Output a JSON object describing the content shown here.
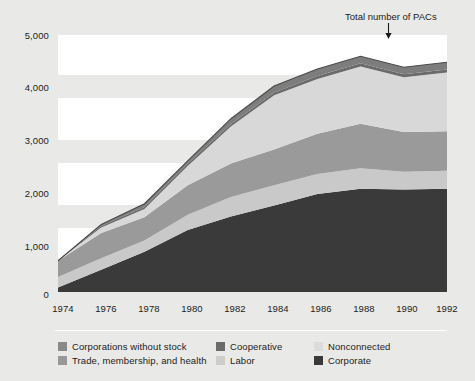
{
  "chart_data": {
    "type": "area",
    "stacked": true,
    "title": "",
    "xlabel": "",
    "ylabel": "",
    "x": [
      1974,
      1976,
      1978,
      1980,
      1982,
      1984,
      1986,
      1988,
      1990,
      1992
    ],
    "categories": [
      1974,
      1976,
      1978,
      1980,
      1982,
      1984,
      1986,
      1988,
      1990,
      1992
    ],
    "xlim": [
      1974,
      1992
    ],
    "ylim": [
      0,
      5000
    ],
    "yticks": [
      0,
      1000,
      2000,
      3000,
      4000,
      5000
    ],
    "ytick_labels": [
      "0",
      "1,000",
      "2,000",
      "3,000",
      "4,000",
      "5,000"
    ],
    "xtick_labels": [
      "1974",
      "1976",
      "1978",
      "1980",
      "1982",
      "1984",
      "1986",
      "1988",
      "1990",
      "1992"
    ],
    "grid": "horizontal-bands",
    "legend_position": "bottom",
    "annotations": [
      {
        "text": "Total number of PACs",
        "points_to": "top-of-stack",
        "arrow": "down",
        "x": 1990
      }
    ],
    "series": [
      {
        "name": "Corporate",
        "color": "#3a3a3a",
        "values": [
          89,
          433,
          785,
          1206,
          1469,
          1682,
          1906,
          2008,
          1995,
          2010
        ]
      },
      {
        "name": "Labor",
        "color": "#c9c9c9",
        "values": [
          201,
          224,
          217,
          297,
          380,
          394,
          388,
          401,
          346,
          347
        ]
      },
      {
        "name": "Trade, membership, and health",
        "color": "#9a9a9a",
        "values": [
          318,
          489,
          453,
          576,
          649,
          698,
          786,
          865,
          774,
          770
        ]
      },
      {
        "name": "Nonconnected",
        "color": "#d8d8d8",
        "values": [
          0,
          110,
          162,
          374,
          723,
          1053,
          1063,
          1115,
          1062,
          1145
        ]
      },
      {
        "name": "Cooperative",
        "color": "#6b6b6b",
        "values": [
          0,
          26,
          36,
          42,
          47,
          52,
          59,
          59,
          59,
          56
        ]
      },
      {
        "name": "Corporations without stock",
        "color": "#7d7d7d",
        "values": [
          0,
          30,
          64,
          56,
          103,
          130,
          138,
          138,
          136,
          142
        ]
      }
    ],
    "totals": [
      608,
      1312,
      1717,
      2551,
      3371,
      4009,
      4340,
      4586,
      4372,
      4470
    ]
  },
  "axis": {
    "y_labels": [
      "5,000",
      "4,000",
      "3,000",
      "2,000",
      "1,000",
      "0"
    ],
    "x_labels": [
      "1974",
      "1976",
      "1978",
      "1980",
      "1982",
      "1984",
      "1986",
      "1988",
      "1990",
      "1992"
    ]
  },
  "annotation": {
    "text": "Total number of PACs"
  },
  "legend": {
    "items": [
      {
        "label": "Corporations without stock",
        "color": "#8a8a8a"
      },
      {
        "label": "Cooperative",
        "color": "#6b6b6b"
      },
      {
        "label": "Nonconnected",
        "color": "#dcdcdc"
      },
      {
        "label": "Trade, membership, and health",
        "color": "#989898"
      },
      {
        "label": "Labor",
        "color": "#cdcdcd"
      },
      {
        "label": "Corporate",
        "color": "#3a3a3a"
      }
    ]
  },
  "colors": {
    "page_background": "#e9e9e7",
    "plot_band": "#ffffff",
    "text": "#1c1c1c"
  }
}
